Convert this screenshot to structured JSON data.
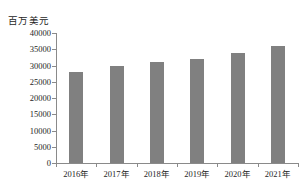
{
  "chart_data": {
    "type": "bar",
    "title": "",
    "xlabel": "",
    "ylabel": "百万美元",
    "categories": [
      "2016年",
      "2017年",
      "2018年",
      "2019年",
      "2020年",
      "2021年"
    ],
    "values": [
      28000,
      30000,
      31000,
      32000,
      34000,
      36000
    ],
    "ylim": [
      0,
      40000
    ],
    "yticks": [
      0,
      5000,
      10000,
      15000,
      20000,
      25000,
      30000,
      35000,
      40000
    ],
    "ytick_labels": [
      "0",
      "5000",
      "10000",
      "15000",
      "20000",
      "25000",
      "30000",
      "35000",
      "40000"
    ],
    "grid": false,
    "legend": false,
    "bar_color": "#808080",
    "axis_color": "#8a8a8a",
    "background_color": "#ffffff"
  }
}
